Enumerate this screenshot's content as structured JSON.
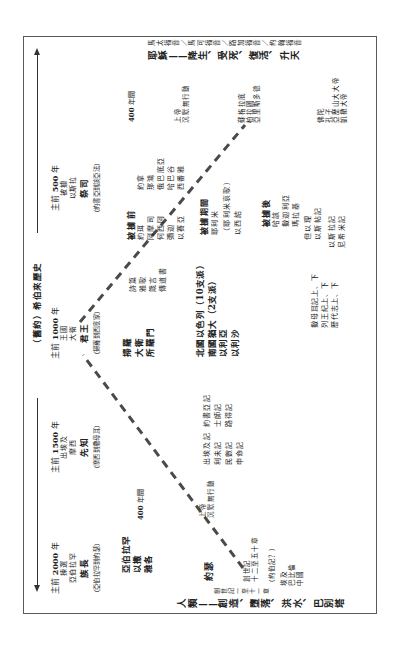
{
  "page": {
    "title": "（舊約）希伯來歷史"
  },
  "eras": [
    {
      "year_prefix": "主前",
      "year": "2000",
      "year_suffix": "年",
      "event": "揀選",
      "person": "亞伯拉罕",
      "role": "族長",
      "span": "（亞伯拉罕到約瑟）"
    },
    {
      "year_prefix": "主前",
      "year": "1500",
      "year_suffix": "年",
      "event": "出埃及",
      "person": "摩西",
      "role": "先知",
      "span": "（摩西到撒母耳）"
    },
    {
      "year_prefix": "主前",
      "year": "1000",
      "year_suffix": "年",
      "event": "王國",
      "person": "大衛",
      "role": "君王",
      "span": "（掃羅到西底家）"
    },
    {
      "year_prefix": "主前",
      "year": "500",
      "year_suffix": "年",
      "event": "被擄",
      "person": "以斯拉",
      "role": "祭司",
      "span": "（約書亞到該亞法）"
    }
  ],
  "timeline_start": {
    "label": "人類——創造、墮落、洪水、巴別塔",
    "reference": "創世記一至十一章"
  },
  "timeline_end": {
    "label": "耶穌——降生、受死、復活、升天",
    "reference": "馬太福音／馬可福音／路加福音／約翰福音"
  },
  "patriarch_period": {
    "patriarchs": [
      "亞伯拉罕",
      "以撒",
      "雅各"
    ],
    "joseph": "約瑟",
    "books": [
      "創世記",
      "十二至五十章"
    ],
    "job_note": "（約伯記？）",
    "nations": [
      "埃及",
      "巴比倫",
      "中國"
    ]
  },
  "silence_egypt": {
    "years": "400",
    "years_unit": "年間",
    "god": [
      "上帝",
      "沉默無行動"
    ]
  },
  "exodus_period": {
    "books_1": [
      "出埃及記",
      "利未記",
      "民數記",
      "申命記"
    ],
    "books_2": [
      "約書亞記",
      "士師記",
      "路得記"
    ]
  },
  "kingdom_period": {
    "kings": [
      "掃羅",
      "大衛",
      "所羅門"
    ],
    "wisdom": [
      "詩篇",
      "雅歌",
      "箴言",
      "傳道書"
    ],
    "divided": [
      "北國以色列（10支派）",
      "南國猶大（2支派）",
      "以利亞",
      "以利沙"
    ],
    "history_books": [
      "撒母耳記上、下",
      "列王紀上、下",
      "歷代志上、下"
    ]
  },
  "exile_period": {
    "before": {
      "header": "被擄前",
      "col1": [
        "約珥",
        "阿摩司",
        "何西阿",
        "彌迦",
        "以賽亞"
      ],
      "col2": [
        "約拿",
        "那鴻",
        "俄巴底亞",
        "哈巴谷",
        "西番雅"
      ]
    },
    "during": {
      "header": "被擄期間",
      "items": [
        "耶利米",
        "（耶利米哀歌）",
        "以西結"
      ]
    },
    "after": {
      "header": "被擄後",
      "items": [
        "哈該",
        "撒迦利亞",
        "瑪拉基"
      ]
    },
    "books_exile": [
      "但以理",
      "以斯帖記"
    ],
    "books_return": [
      "以斯拉記",
      "尼希米記"
    ]
  },
  "silence_intertestament": {
    "years": "400",
    "years_unit": "年間",
    "god": [
      "上帝",
      "沉默無行動"
    ]
  },
  "world_history": {
    "greek_philosophers": [
      "蘇格拉底",
      "柏拉圖",
      "亞里斯多德"
    ],
    "figures": [
      "佛陀",
      "孔子",
      "亞歷山大大帝",
      "凱撒大帝"
    ]
  },
  "style": {
    "text_color": "#222222",
    "line_color": "#4a4a4a",
    "background": "#ffffff"
  }
}
